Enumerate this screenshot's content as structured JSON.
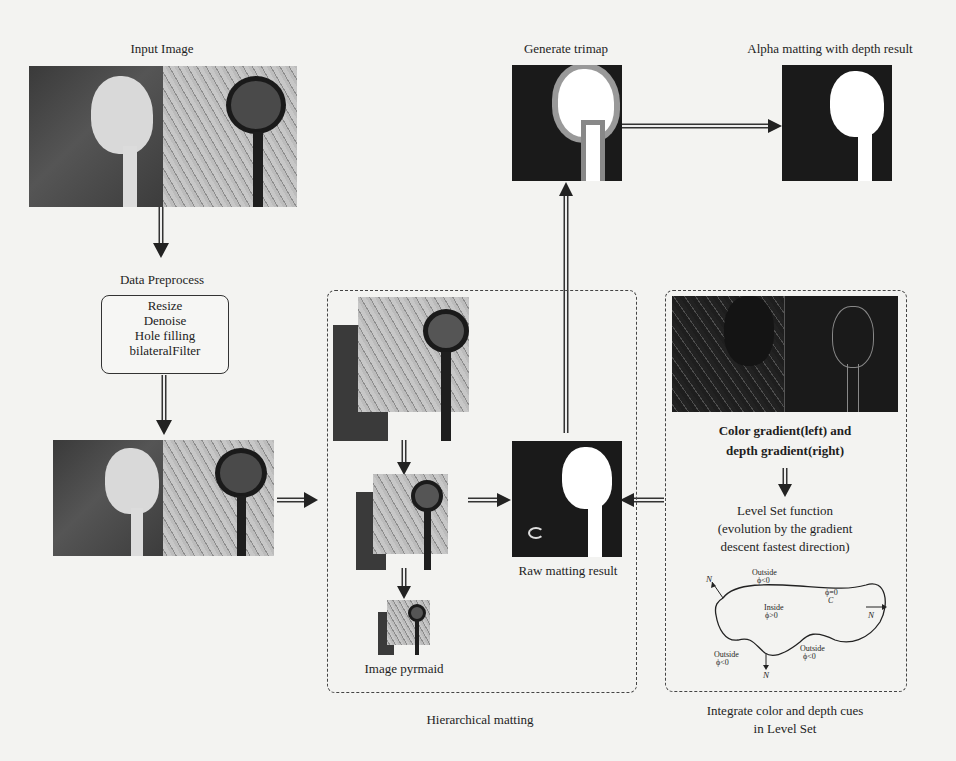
{
  "figure": {
    "nodes": {
      "input_image": {
        "label": "Input Image"
      },
      "data_preprocess": {
        "label": "Data Preprocess",
        "steps": [
          "Resize",
          "Denoise",
          "Hole filling",
          "bilateralFilter"
        ]
      },
      "generate_trimap": {
        "label": "Generate trimap"
      },
      "alpha_matting": {
        "label": "Alpha matting with depth result"
      },
      "raw_matting": {
        "label": "Raw matting result"
      },
      "image_pyramid": {
        "label": "Image pyrmaid"
      },
      "hierarchical_matting": {
        "label": "Hierarchical matting"
      },
      "gradients": {
        "line1": "Color gradient(left) and",
        "line2": "depth gradient(right)"
      },
      "level_set": {
        "line1": "Level Set function",
        "line2": "(evolution by the gradient",
        "line3": "descent fastest direction)"
      },
      "level_set_group": {
        "line1": "Integrate color and depth  cues",
        "line2": "in Level Set"
      }
    },
    "level_set_diagram": {
      "outside_top": "Outside",
      "outside_top_phi": "ϕ<0",
      "inside": "Inside",
      "inside_phi": "ϕ>0",
      "boundary_phi": "ϕ=0",
      "curve": "C",
      "normal": "N",
      "outside_left": "Outside",
      "outside_left_phi": "ϕ<0",
      "outside_right": "Outside",
      "outside_right_phi": "ϕ<0"
    },
    "colors": {
      "stroke": "#333333",
      "image_dark": "#1a1a1a",
      "background": "#f3f3f1"
    }
  }
}
